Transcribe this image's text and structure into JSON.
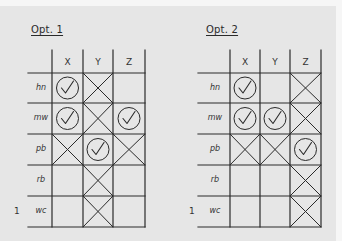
{
  "colors": {
    "background": "#e6e6e6",
    "ink": "#2a2a2a"
  },
  "options": [
    {
      "title": "Opt. 1",
      "columns": [
        "X",
        "Y",
        "Z"
      ],
      "rows": [
        {
          "label": "hn",
          "cells": [
            "check",
            "cross",
            "empty"
          ]
        },
        {
          "label": "mw",
          "cells": [
            "check",
            "cross",
            "check"
          ]
        },
        {
          "label": "pb",
          "cells": [
            "cross",
            "check",
            "cross"
          ]
        },
        {
          "label": "rb",
          "cells": [
            "empty",
            "cross",
            "empty"
          ]
        },
        {
          "label": "wc",
          "cells": [
            "empty",
            "cross",
            "empty"
          ],
          "marker": "1"
        }
      ]
    },
    {
      "title": "Opt. 2",
      "columns": [
        "X",
        "Y",
        "Z"
      ],
      "rows": [
        {
          "label": "hn",
          "cells": [
            "check",
            "empty",
            "cross"
          ]
        },
        {
          "label": "mw",
          "cells": [
            "check",
            "check",
            "cross"
          ]
        },
        {
          "label": "pb",
          "cells": [
            "cross",
            "cross",
            "check"
          ]
        },
        {
          "label": "rb",
          "cells": [
            "empty",
            "empty",
            "cross"
          ]
        },
        {
          "label": "wc",
          "cells": [
            "empty",
            "empty",
            "cross"
          ],
          "marker": "1"
        }
      ]
    }
  ]
}
